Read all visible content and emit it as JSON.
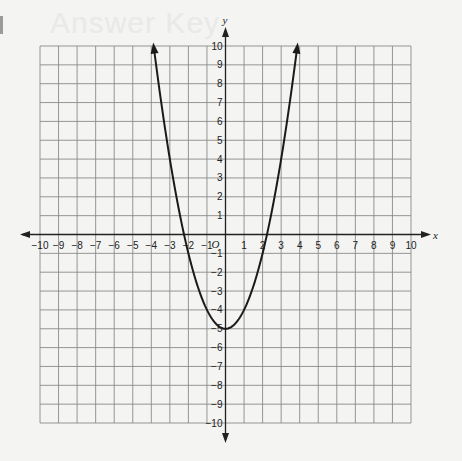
{
  "page": {
    "background_text": "Answer Key"
  },
  "chart_data": {
    "type": "line",
    "title": "",
    "function": "y = x^2 - 5",
    "xlabel": "x",
    "ylabel": "y",
    "origin_label": "O",
    "xlim": [
      -10,
      10
    ],
    "ylim": [
      -10,
      10
    ],
    "grid": true,
    "x_ticks": [
      -10,
      -9,
      -8,
      -7,
      -6,
      -5,
      -4,
      -3,
      -2,
      -1,
      1,
      2,
      3,
      4,
      5,
      6,
      7,
      8,
      9,
      10
    ],
    "y_ticks": [
      -10,
      -9,
      -8,
      -7,
      -6,
      -5,
      -4,
      -3,
      -2,
      -1,
      1,
      2,
      3,
      4,
      5,
      6,
      7,
      8,
      9,
      10
    ],
    "series": [
      {
        "name": "parabola",
        "color": "#1a1a1a",
        "vertex": [
          0,
          -5
        ],
        "x_intercepts": [
          -2.24,
          2.24
        ],
        "endpoints_with_arrows": [
          [
            -3.87,
            10
          ],
          [
            3.87,
            10
          ]
        ],
        "x": [
          -3.87,
          -3,
          -2,
          -1,
          0,
          1,
          2,
          3,
          3.87
        ],
        "y": [
          10,
          4,
          -1,
          -4,
          -5,
          -4,
          -1,
          4,
          10
        ]
      }
    ]
  }
}
